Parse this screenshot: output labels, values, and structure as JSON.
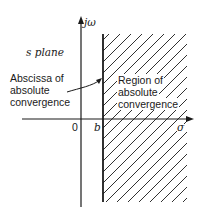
{
  "diagram": {
    "plane_label": "s plane",
    "axes": {
      "vertical_label": "jω",
      "horizontal_label": "σ",
      "origin_label": "0",
      "boundary_label": "b"
    },
    "annotations": {
      "abscissa": [
        "Abscissa of",
        "absolute",
        "convergence"
      ],
      "region": [
        "Region of",
        "absolute",
        "convergence"
      ]
    },
    "colors": {
      "ink": "#1a1a1a",
      "background": "#ffffff"
    }
  }
}
